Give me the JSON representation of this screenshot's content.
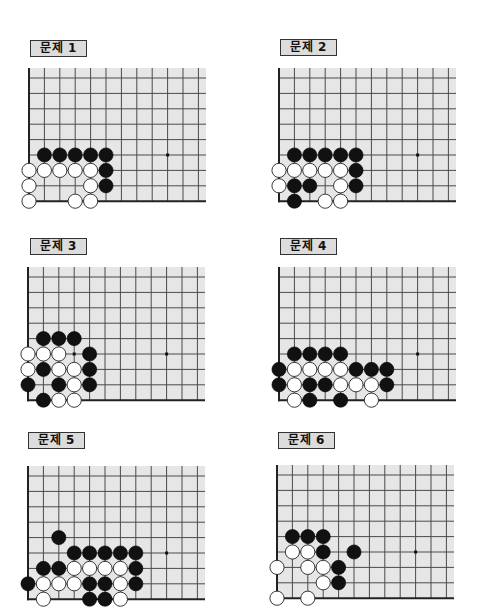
{
  "page": {
    "background": "#ffffff",
    "board_color": "#e6e6e6",
    "line_color": "#4a4a4a",
    "black_stone": "#111111",
    "white_stone": "#ffffff"
  },
  "board_geometry": {
    "spacing": 15.4,
    "columns_visible": 12,
    "rows": 9,
    "top_margin": 10,
    "right_extent": 177,
    "hoshi": [
      [
        5,
        9
      ]
    ]
  },
  "problems": [
    {
      "label": "문제 1",
      "label_pos": [
        30,
        40
      ],
      "origin": [
        29,
        78
      ],
      "stones": {
        "black": [
          [
            5,
            1
          ],
          [
            5,
            2
          ],
          [
            5,
            3
          ],
          [
            5,
            4
          ],
          [
            5,
            5
          ],
          [
            6,
            5
          ],
          [
            7,
            5
          ]
        ],
        "white": [
          [
            6,
            0
          ],
          [
            6,
            1
          ],
          [
            6,
            2
          ],
          [
            6,
            3
          ],
          [
            6,
            4
          ],
          [
            7,
            0
          ],
          [
            7,
            4
          ],
          [
            8,
            0
          ],
          [
            8,
            3
          ],
          [
            8,
            4
          ]
        ]
      },
      "marks": []
    },
    {
      "label": "문제 2",
      "label_pos": [
        280,
        39
      ],
      "origin": [
        279,
        78
      ],
      "stones": {
        "black": [
          [
            5,
            1
          ],
          [
            5,
            2
          ],
          [
            5,
            3
          ],
          [
            5,
            4
          ],
          [
            5,
            5
          ],
          [
            6,
            5
          ],
          [
            7,
            1
          ],
          [
            7,
            2
          ],
          [
            7,
            5
          ],
          [
            8,
            1
          ]
        ],
        "white": [
          [
            6,
            0
          ],
          [
            6,
            1
          ],
          [
            6,
            2
          ],
          [
            6,
            3
          ],
          [
            6,
            4
          ],
          [
            7,
            0
          ],
          [
            7,
            4
          ],
          [
            8,
            3
          ],
          [
            8,
            4
          ]
        ]
      },
      "marks": []
    },
    {
      "label": "문제 3",
      "label_pos": [
        30,
        238
      ],
      "origin": [
        28,
        277
      ],
      "stones": {
        "black": [
          [
            4,
            1
          ],
          [
            4,
            2
          ],
          [
            4,
            3
          ],
          [
            5,
            4
          ],
          [
            6,
            1
          ],
          [
            6,
            4
          ],
          [
            7,
            0
          ],
          [
            7,
            2
          ],
          [
            7,
            4
          ],
          [
            8,
            1
          ]
        ],
        "white": [
          [
            5,
            0
          ],
          [
            5,
            1
          ],
          [
            5,
            2
          ],
          [
            6,
            0
          ],
          [
            6,
            2
          ],
          [
            6,
            3
          ],
          [
            7,
            3
          ],
          [
            8,
            2
          ],
          [
            8,
            3
          ]
        ]
      },
      "marks": [
        [
          5,
          3
        ]
      ]
    },
    {
      "label": "문제 4",
      "label_pos": [
        280,
        238
      ],
      "origin": [
        279,
        277
      ],
      "stones": {
        "black": [
          [
            5,
            1
          ],
          [
            5,
            2
          ],
          [
            5,
            3
          ],
          [
            5,
            4
          ],
          [
            6,
            0
          ],
          [
            6,
            5
          ],
          [
            6,
            6
          ],
          [
            6,
            7
          ],
          [
            7,
            0
          ],
          [
            7,
            2
          ],
          [
            7,
            3
          ],
          [
            7,
            7
          ],
          [
            8,
            2
          ],
          [
            8,
            4
          ]
        ],
        "white": [
          [
            6,
            1
          ],
          [
            6,
            2
          ],
          [
            6,
            3
          ],
          [
            6,
            4
          ],
          [
            7,
            1
          ],
          [
            7,
            4
          ],
          [
            7,
            5
          ],
          [
            7,
            6
          ],
          [
            8,
            1
          ],
          [
            8,
            6
          ]
        ]
      },
      "marks": []
    },
    {
      "label": "문제 5",
      "label_pos": [
        28,
        432
      ],
      "origin": [
        28,
        476
      ],
      "stones": {
        "black": [
          [
            4,
            2
          ],
          [
            5,
            3
          ],
          [
            5,
            4
          ],
          [
            5,
            5
          ],
          [
            5,
            6
          ],
          [
            5,
            7
          ],
          [
            6,
            1
          ],
          [
            6,
            2
          ],
          [
            6,
            7
          ],
          [
            7,
            0
          ],
          [
            7,
            4
          ],
          [
            7,
            5
          ],
          [
            7,
            7
          ],
          [
            8,
            4
          ],
          [
            8,
            5
          ]
        ],
        "white": [
          [
            6,
            3
          ],
          [
            6,
            4
          ],
          [
            6,
            5
          ],
          [
            6,
            6
          ],
          [
            7,
            1
          ],
          [
            7,
            2
          ],
          [
            7,
            3
          ],
          [
            7,
            6
          ],
          [
            8,
            1
          ],
          [
            8,
            6
          ]
        ]
      },
      "marks": []
    },
    {
      "label": "문제 6",
      "label_pos": [
        278,
        432
      ],
      "origin": [
        277,
        475
      ],
      "stones": {
        "black": [
          [
            4,
            1
          ],
          [
            4,
            2
          ],
          [
            4,
            3
          ],
          [
            5,
            3
          ],
          [
            5,
            5
          ],
          [
            6,
            4
          ],
          [
            7,
            4
          ]
        ],
        "white": [
          [
            5,
            1
          ],
          [
            5,
            2
          ],
          [
            6,
            0
          ],
          [
            6,
            2
          ],
          [
            6,
            3
          ],
          [
            7,
            3
          ],
          [
            8,
            0
          ],
          [
            8,
            2
          ]
        ]
      },
      "marks": []
    }
  ]
}
